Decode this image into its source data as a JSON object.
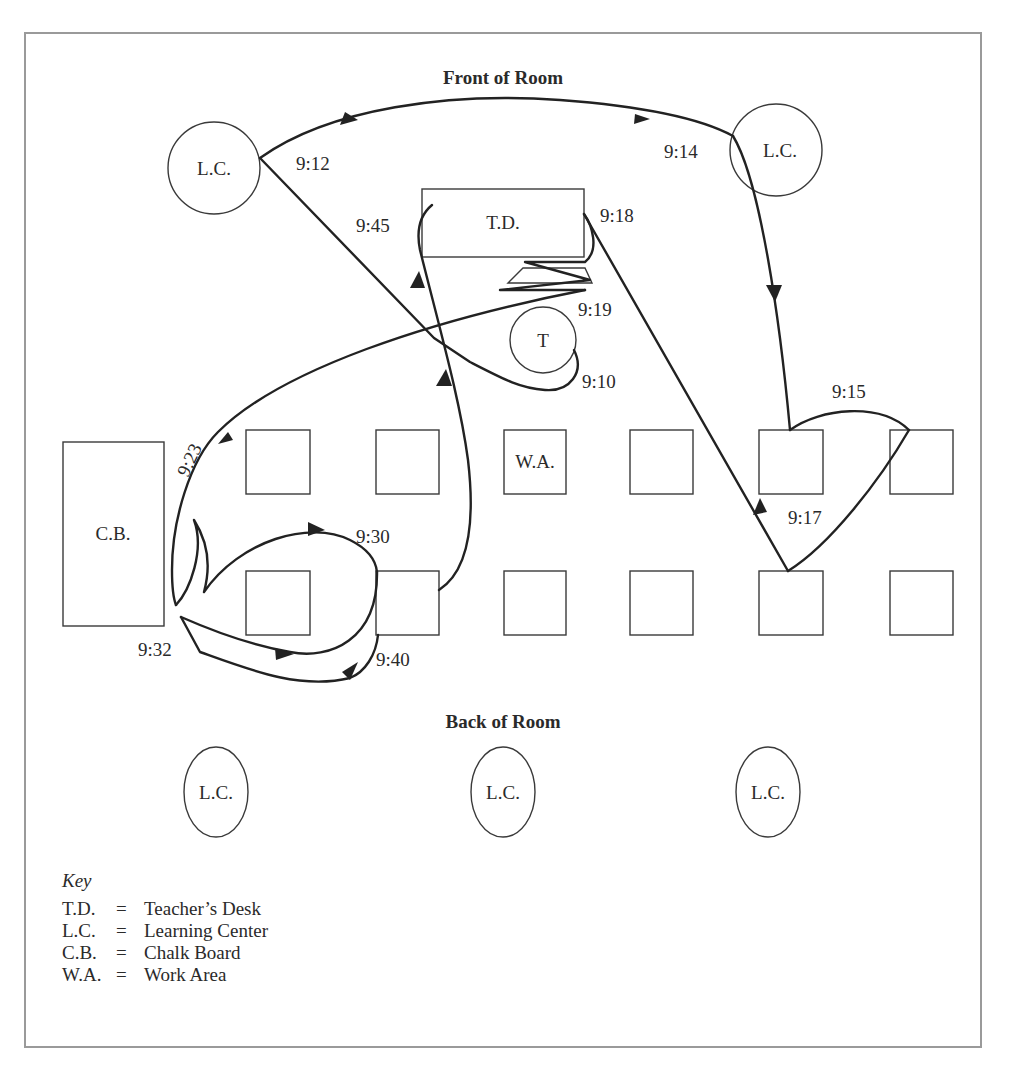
{
  "headings": {
    "front": "Front of Room",
    "back": "Back of Room"
  },
  "fixtures": {
    "teacher_desk": "T.D.",
    "teacher": "T",
    "chalk_board": "C.B.",
    "work_area": "W.A.",
    "learning_centers": [
      "L.C.",
      "L.C.",
      "L.C.",
      "L.C.",
      "L.C."
    ]
  },
  "times": {
    "t910": "9:10",
    "t912": "9:12",
    "t914": "9:14",
    "t915": "9:15",
    "t917": "9:17",
    "t918": "9:18",
    "t919": "9:19",
    "t923": "9:23",
    "t930": "9:30",
    "t932": "9:32",
    "t940": "9:40",
    "t945": "9:45"
  },
  "key": {
    "title": "Key",
    "entries": [
      {
        "abbr": "T.D.",
        "eq": "=",
        "meaning": "Teacher’s Desk"
      },
      {
        "abbr": "L.C.",
        "eq": "=",
        "meaning": "Learning Center"
      },
      {
        "abbr": "C.B.",
        "eq": "=",
        "meaning": "Chalk Board"
      },
      {
        "abbr": "W.A.",
        "eq": "=",
        "meaning": "Work Area"
      }
    ]
  },
  "colors": {
    "frame": "#9a9a9a",
    "stroke": "#222222"
  }
}
